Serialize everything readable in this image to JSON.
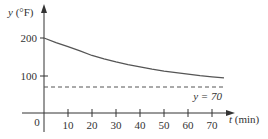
{
  "chart_data": {
    "type": "line",
    "title": "",
    "xlabel": "t (min)",
    "ylabel": "y (°F)",
    "xlabel_var": "t",
    "xlabel_unit": "(min)",
    "ylabel_var": "y",
    "ylabel_unit": "(°F)",
    "xlim": [
      0,
      75
    ],
    "ylim": [
      0,
      220
    ],
    "x_ticks": [
      10,
      20,
      30,
      40,
      50,
      60,
      70
    ],
    "x_tick_labels": [
      "10",
      "20",
      "30",
      "40",
      "50",
      "60",
      "70"
    ],
    "y_ticks": [
      100,
      200
    ],
    "y_tick_labels": [
      "100",
      "200"
    ],
    "origin_label": "0",
    "grid": false,
    "series": [
      {
        "name": "temperature",
        "style": "solid",
        "x": [
          0,
          5,
          10,
          15,
          20,
          25,
          30,
          35,
          40,
          45,
          50,
          55,
          60,
          65,
          70,
          75
        ],
        "values": [
          200,
          188,
          177,
          166,
          154,
          145,
          137,
          130,
          124,
          118,
          113,
          109,
          105,
          101,
          98,
          95
        ]
      },
      {
        "name": "asymptote",
        "style": "dashed",
        "x": [
          0,
          75
        ],
        "values": [
          70,
          70
        ],
        "annotation": "y = 70"
      }
    ],
    "annotations": [
      "y = 70"
    ]
  },
  "labels": {
    "y_var": "y",
    "y_unit": " (°F)",
    "x_var": "t",
    "x_unit": " (min)",
    "origin": "0",
    "asymptote": "y = 70",
    "ytick_200": "200",
    "ytick_100": "100",
    "xtick_10": "10",
    "xtick_20": "20",
    "xtick_30": "30",
    "xtick_40": "40",
    "xtick_50": "50",
    "xtick_60": "60",
    "xtick_70": "70"
  },
  "colors": {
    "axis": "#333333",
    "curve": "#555555",
    "dashed": "#555555",
    "text": "#333333"
  }
}
